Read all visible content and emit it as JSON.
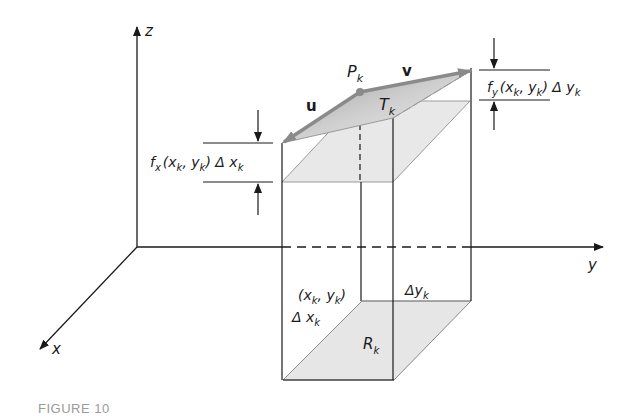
{
  "figure": {
    "caption": "FIGURE 10",
    "axes": {
      "x": "x",
      "y": "y",
      "z": "z"
    },
    "labels": {
      "point": "P",
      "point_sub": "k",
      "tangent_plane": "T",
      "tangent_plane_sub": "k",
      "region": "R",
      "region_sub": "k",
      "vector_u": "u",
      "vector_v": "v",
      "fx_term": {
        "f": "f",
        "f_sub": "x",
        "args_a": "(x",
        "args_a_sub": "k",
        "args_b": ", y",
        "args_b_sub": "k",
        "args_close": ") Δ x",
        "delta_sub": "k"
      },
      "fy_term": {
        "f": "f",
        "f_sub": "y",
        "args_a": "(x",
        "args_a_sub": "k",
        "args_b": ", y",
        "args_b_sub": "k",
        "args_close": ") Δ y",
        "delta_sub": "k"
      },
      "base_point": {
        "open": "(x",
        "a_sub": "k",
        "mid": ", y",
        "b_sub": "k",
        "close": ")"
      },
      "delta_x": {
        "text": "Δ x",
        "sub": "k"
      },
      "delta_y": {
        "text": "Δy",
        "sub": "k"
      }
    },
    "colors": {
      "line": "#1a1a1a",
      "shade": "#e6e6e6",
      "tangent_fill": "#c8c8c8",
      "vector": "#8a8a8a",
      "caption": "#9a9a9a"
    }
  }
}
